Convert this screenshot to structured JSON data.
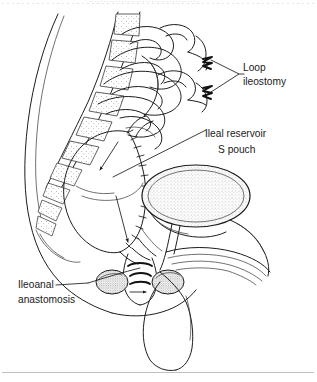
{
  "figure": {
    "kind": "medical-line-drawing",
    "view": "sagittal pelvic section",
    "background_color": "#ffffff",
    "ink_color": "#1d1d1d",
    "text_color": "#1a1a1a"
  },
  "labels": [
    {
      "id": "loop-ileostomy",
      "line1": "Loop",
      "line2": "ileostomy",
      "x": 243,
      "y": 68,
      "leader": "bracket converging from two ileostomy stomas"
    },
    {
      "id": "ileal-reservoir",
      "line1": "Ileal reservoir",
      "line2": "S pouch",
      "x": 205,
      "y": 135,
      "leader": "diagonal line to pouch body"
    },
    {
      "id": "ileoanal-anastomosis",
      "line1": "Ileoanal",
      "line2": "anastomosis",
      "x": 18,
      "y": 285,
      "leader": "line rising to anal canal junction"
    }
  ],
  "structures": [
    {
      "name": "lumbar-sacral-spine",
      "shading": "sparse-stipple"
    },
    {
      "name": "small-bowel-loops",
      "shading": "outline"
    },
    {
      "name": "ileal-s-pouch",
      "shading": "outline-with-sutures"
    },
    {
      "name": "urinary-bladder",
      "shading": "medium-stipple"
    },
    {
      "name": "anal-sphincter-muscle",
      "shading": "dense-stipple"
    },
    {
      "name": "abdominal-wall",
      "shading": "outline"
    },
    {
      "name": "ileostomy-stoma-upper",
      "shading": "outline"
    },
    {
      "name": "ileostomy-stoma-lower",
      "shading": "outline"
    }
  ],
  "page": {
    "bottom_rule": true,
    "top_scan_artifact": true
  }
}
